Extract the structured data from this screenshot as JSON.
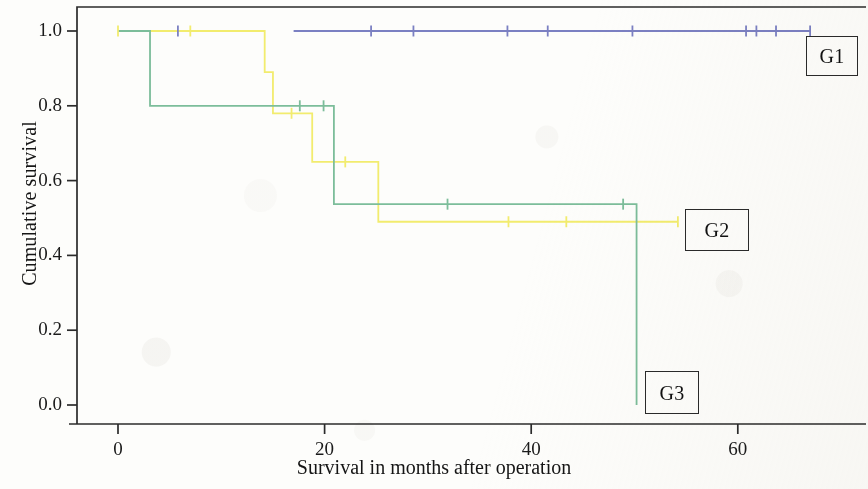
{
  "figure": {
    "background_color": "#fdfdfb",
    "axis_color": "#2b2b2b"
  },
  "axes": {
    "x_title": "Survival in months after operation",
    "y_title": "Cumulative survival",
    "x_ticks": [
      "0",
      "20",
      "40",
      "60"
    ],
    "x_tick_values": [
      0,
      20,
      40,
      60
    ],
    "y_ticks": [
      "0.0",
      "0.2",
      "0.4",
      "0.6",
      "0.8",
      "1.0"
    ],
    "y_tick_values": [
      0.0,
      0.2,
      0.4,
      0.6,
      0.8,
      1.0
    ]
  },
  "series_labels": [
    {
      "name": "G1",
      "text": "G1"
    },
    {
      "name": "G2",
      "text": "G2"
    },
    {
      "name": "G3",
      "text": "G3"
    }
  ],
  "chart_data": {
    "type": "line",
    "subtype": "kaplan-meier-survival",
    "title": "",
    "xlabel": "Survival in months after operation",
    "ylabel": "Cumulative survival",
    "xlim": [
      -2,
      72
    ],
    "ylim": [
      -0.04,
      1.04
    ],
    "grid": false,
    "legend_position": "inline-right-boxed-labels",
    "step_interpolation": "post",
    "series": [
      {
        "name": "G1",
        "label": "G1",
        "color": "#7b80c2",
        "points": [
          {
            "x": 17.0,
            "y": 1.0
          },
          {
            "x": 67.0,
            "y": 1.0
          }
        ],
        "censored": [
          {
            "x": 5.8,
            "y": 1.0
          },
          {
            "x": 24.5,
            "y": 1.0
          },
          {
            "x": 28.6,
            "y": 1.0
          },
          {
            "x": 37.7,
            "y": 1.0
          },
          {
            "x": 41.6,
            "y": 1.0
          },
          {
            "x": 49.8,
            "y": 1.0
          },
          {
            "x": 60.8,
            "y": 1.0
          },
          {
            "x": 61.8,
            "y": 1.0
          },
          {
            "x": 63.7,
            "y": 1.0
          },
          {
            "x": 67.0,
            "y": 1.0
          }
        ],
        "note": "no events; flat at 1.0 across follow-up"
      },
      {
        "name": "G2",
        "label": "G2",
        "color": "#f2ec6e",
        "points": [
          {
            "x": 0.0,
            "y": 1.0
          },
          {
            "x": 14.2,
            "y": 1.0
          },
          {
            "x": 14.2,
            "y": 0.89
          },
          {
            "x": 15.0,
            "y": 0.89
          },
          {
            "x": 15.0,
            "y": 0.78
          },
          {
            "x": 18.8,
            "y": 0.78
          },
          {
            "x": 18.8,
            "y": 0.65
          },
          {
            "x": 25.2,
            "y": 0.65
          },
          {
            "x": 25.2,
            "y": 0.49
          },
          {
            "x": 54.2,
            "y": 0.49
          }
        ],
        "censored": [
          {
            "x": 0.0,
            "y": 1.0
          },
          {
            "x": 7.0,
            "y": 1.0
          },
          {
            "x": 16.8,
            "y": 0.78
          },
          {
            "x": 22.0,
            "y": 0.65
          },
          {
            "x": 37.8,
            "y": 0.49
          },
          {
            "x": 43.4,
            "y": 0.49
          },
          {
            "x": 54.2,
            "y": 0.49
          }
        ]
      },
      {
        "name": "G3",
        "label": "G3",
        "color": "#7cbd9a",
        "points": [
          {
            "x": 0.0,
            "y": 1.0
          },
          {
            "x": 3.1,
            "y": 1.0
          },
          {
            "x": 3.1,
            "y": 0.8
          },
          {
            "x": 20.9,
            "y": 0.8
          },
          {
            "x": 20.9,
            "y": 0.537
          },
          {
            "x": 50.2,
            "y": 0.537
          },
          {
            "x": 50.2,
            "y": 0.0
          }
        ],
        "censored": [
          {
            "x": 17.6,
            "y": 0.8
          },
          {
            "x": 19.9,
            "y": 0.8
          },
          {
            "x": 31.9,
            "y": 0.537
          },
          {
            "x": 48.9,
            "y": 0.537
          }
        ]
      }
    ]
  }
}
